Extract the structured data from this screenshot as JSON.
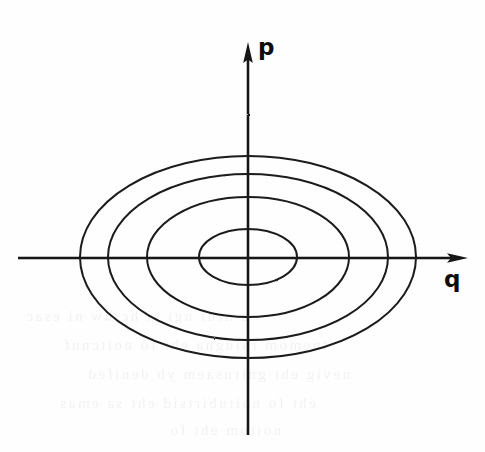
{
  "figure": {
    "kind": "phase-space-diagram",
    "background_color": "#fefefe",
    "ink_color": "#1a1a1a",
    "width": 485,
    "height": 452,
    "origin": {
      "x": 248,
      "y": 257
    },
    "axes": {
      "vertical": {
        "label": "p",
        "label_x": 258,
        "label_y": 36,
        "x": 248,
        "y_top": 42,
        "y_bottom": 435,
        "arrow": "up",
        "stroke_width": 2.6
      },
      "horizontal": {
        "label": "q",
        "label_x": 444,
        "label_y": 268,
        "y": 258,
        "x_left": 18,
        "x_right": 468,
        "arrow": "right",
        "stroke_width": 2.6
      }
    }
  },
  "chart_data": {
    "type": "line",
    "title": "",
    "xlabel": "q",
    "ylabel": "p",
    "grid": false,
    "legend": "none",
    "axis_style": "arrow-axes-through-origin",
    "curve_family": "concentric-ellipses",
    "curve_count": 4,
    "center": {
      "q": 0,
      "p": 0
    },
    "curves": [
      {
        "name": "ellipse-1-innermost",
        "semi_axis_q": 49,
        "semi_axis_p": 28,
        "q_min": 199,
        "q_max": 297,
        "p_top": 229,
        "p_bottom": 285,
        "stroke_width": 2.0
      },
      {
        "name": "ellipse-2",
        "semi_axis_q": 101,
        "semi_axis_p": 60,
        "q_min": 147,
        "q_max": 349,
        "p_top": 197,
        "p_bottom": 317,
        "stroke_width": 2.0
      },
      {
        "name": "ellipse-3",
        "semi_axis_q": 140,
        "semi_axis_p": 83,
        "q_min": 108,
        "q_max": 388,
        "p_top": 174,
        "p_bottom": 340,
        "stroke_width": 2.0
      },
      {
        "name": "ellipse-4-outermost",
        "semi_axis_q": 168,
        "semi_axis_p": 101,
        "q_min": 80,
        "q_max": 416,
        "p_top": 156,
        "p_bottom": 358,
        "stroke_width": 2.0
      }
    ],
    "series": [
      {
        "name": "ellipse-1-innermost",
        "semi_axes": [
          49,
          28
        ]
      },
      {
        "name": "ellipse-2",
        "semi_axes": [
          101,
          60
        ]
      },
      {
        "name": "ellipse-3",
        "semi_axes": [
          140,
          83
        ]
      },
      {
        "name": "ellipse-4-outermost",
        "semi_axes": [
          168,
          101
        ]
      }
    ],
    "xlim": [
      -230,
      220
    ],
    "ylim": [
      -178,
      215
    ]
  },
  "ghost_text": {
    "note": "faint reverse-side bleed-through from the scanned page; illegible",
    "lines": [
      "a nrul ngi si hcihw ni esac",
      "tnemom ralugna eht fo noitcnuf",
      "nevig eht gnirusaem yb denifed",
      "eht fo noitubirtsid eht sa emas",
      "noitom eht fo"
    ]
  }
}
